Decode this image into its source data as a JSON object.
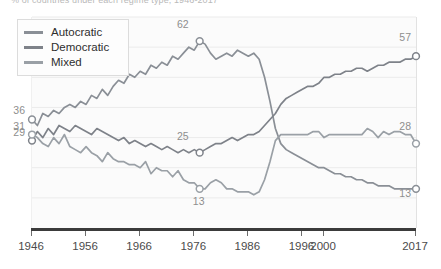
{
  "caption": "% of countries under each regime type, 1946-2017",
  "legend": {
    "position": "top-left",
    "items": [
      {
        "label": "Autocratic",
        "color": "#8a8f96"
      },
      {
        "label": "Democratic",
        "color": "#7e8289"
      },
      {
        "label": "Mixed",
        "color": "#9aa0a6"
      }
    ]
  },
  "axis": {
    "xticks": [
      "1946",
      "1956",
      "1966",
      "1976",
      "1986",
      "1996",
      "2000",
      "2017"
    ],
    "xtick_years": [
      1946,
      1956,
      1966,
      1976,
      1986,
      1996,
      2000,
      2017
    ]
  },
  "annotations": {
    "left": [
      {
        "text": "36",
        "series": "Autocratic"
      },
      {
        "text": "31",
        "series": "Mixed"
      },
      {
        "text": "29",
        "series": "Democratic"
      }
    ],
    "right": [
      {
        "text": "57",
        "series": "Democratic"
      },
      {
        "text": "28",
        "series": "Mixed"
      },
      {
        "text": "13",
        "series": "Autocratic"
      }
    ],
    "inner": [
      {
        "text": "62",
        "series": "Autocratic",
        "year": 1977
      },
      {
        "text": "25",
        "series": "Democratic",
        "year": 1977
      },
      {
        "text": "13",
        "series": "Mixed",
        "year": 1977
      }
    ]
  },
  "chart_data": {
    "type": "line",
    "title": "",
    "subtitle": "",
    "xlabel": "",
    "ylabel": "",
    "xlim": [
      1946,
      2017
    ],
    "ylim": [
      0,
      70
    ],
    "grid": true,
    "gridlines_y": [
      10,
      20,
      30,
      40,
      50,
      60,
      70
    ],
    "legend_position": "top-left",
    "marker": "open-circle",
    "x": [
      1946,
      1947,
      1948,
      1949,
      1950,
      1951,
      1952,
      1953,
      1954,
      1955,
      1956,
      1957,
      1958,
      1959,
      1960,
      1961,
      1962,
      1963,
      1964,
      1965,
      1966,
      1967,
      1968,
      1969,
      1970,
      1971,
      1972,
      1973,
      1974,
      1975,
      1976,
      1977,
      1978,
      1979,
      1980,
      1981,
      1982,
      1983,
      1984,
      1985,
      1986,
      1987,
      1988,
      1989,
      1990,
      1991,
      1992,
      1993,
      1994,
      1995,
      1996,
      1997,
      1998,
      1999,
      2000,
      2001,
      2002,
      2003,
      2004,
      2005,
      2006,
      2007,
      2008,
      2009,
      2010,
      2011,
      2012,
      2013,
      2014,
      2015,
      2016,
      2017
    ],
    "series": [
      {
        "name": "Autocratic",
        "color": "#8a8f96",
        "endpoint_labels": {
          "start": 36,
          "end": 13
        },
        "peak": {
          "year": 1977,
          "value": 62
        },
        "values": [
          36,
          34,
          38,
          37,
          39,
          38,
          40,
          41,
          40,
          42,
          41,
          44,
          43,
          46,
          44,
          47,
          49,
          48,
          51,
          50,
          52,
          51,
          54,
          53,
          55,
          54,
          57,
          56,
          58,
          60,
          59,
          62,
          61,
          58,
          56,
          57,
          58,
          57,
          59,
          58,
          57,
          58,
          56,
          50,
          42,
          33,
          28,
          26,
          25,
          24,
          23,
          22,
          21,
          20,
          20,
          19,
          18,
          18,
          17,
          17,
          16,
          16,
          15,
          15,
          14,
          14,
          14,
          13,
          13,
          13,
          13,
          13
        ]
      },
      {
        "name": "Democratic",
        "color": "#7e8289",
        "endpoint_labels": {
          "start": 29,
          "end": 57
        },
        "midpoint": {
          "year": 1977,
          "value": 25
        },
        "values": [
          29,
          32,
          30,
          33,
          31,
          34,
          33,
          32,
          34,
          33,
          32,
          31,
          33,
          32,
          31,
          30,
          29,
          30,
          28,
          29,
          28,
          27,
          28,
          27,
          26,
          27,
          26,
          25,
          26,
          25,
          26,
          25,
          26,
          27,
          28,
          28,
          29,
          30,
          29,
          30,
          31,
          31,
          32,
          34,
          36,
          38,
          41,
          43,
          44,
          45,
          46,
          47,
          47,
          48,
          50,
          50,
          51,
          51,
          52,
          52,
          53,
          53,
          52,
          53,
          54,
          54,
          55,
          55,
          55,
          56,
          56,
          57
        ]
      },
      {
        "name": "Mixed",
        "color": "#9aa0a6",
        "endpoint_labels": {
          "start": 31,
          "end": 28
        },
        "trough": {
          "year": 1977,
          "value": 13
        },
        "values": [
          31,
          30,
          28,
          27,
          30,
          28,
          31,
          27,
          26,
          25,
          27,
          25,
          24,
          22,
          25,
          23,
          22,
          22,
          21,
          21,
          20,
          22,
          18,
          20,
          19,
          19,
          17,
          19,
          16,
          15,
          15,
          13,
          13,
          15,
          16,
          15,
          13,
          13,
          12,
          12,
          12,
          11,
          12,
          16,
          22,
          29,
          31,
          31,
          31,
          31,
          31,
          31,
          32,
          32,
          30,
          31,
          31,
          31,
          31,
          31,
          31,
          31,
          33,
          32,
          30,
          32,
          31,
          32,
          32,
          31,
          31,
          28
        ]
      }
    ]
  }
}
